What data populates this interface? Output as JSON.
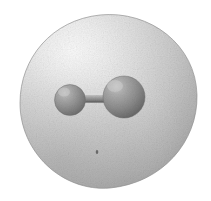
{
  "figure": {
    "kind": "molecular-orbital-isosurface-render",
    "title": "Diatomic molecule enclosed in electron density isosurface",
    "background_color": "#ffffff",
    "canvas": {
      "width": 211,
      "height": 201
    },
    "render_style": "grayscale dithered halftone shaded 3D render",
    "isosurface": {
      "name": "electron density isosurface",
      "shape": "egg-shaped ovoid, wider and rounder on the right, tapering to the left",
      "center_x": 108,
      "center_y": 101,
      "radius_x": 89,
      "radius_y": 87,
      "bounds": {
        "left": 20,
        "top": 14,
        "right": 197,
        "bottom": 188
      },
      "fill_light": "#f2f2f2",
      "fill_mid": "#c9c9c9",
      "fill_dark": "#9a9a9a",
      "rim_color": "#8e8e8e",
      "highlight_x": 72,
      "highlight_y": 52,
      "opacity": 0.92
    },
    "atoms": [
      {
        "label": "left atom",
        "cx": 70,
        "cy": 100,
        "r": 15.5,
        "fill_light": "#b4b4b4",
        "fill_mid": "#8d8d8d",
        "fill_dark": "#6a6a6a",
        "highlight_x": 64,
        "highlight_y": 92
      },
      {
        "label": "right atom",
        "cx": 124,
        "cy": 97,
        "r": 21,
        "fill_light": "#b8b8b8",
        "fill_mid": "#8a8a8a",
        "fill_dark": "#646464",
        "highlight_x": 115,
        "highlight_y": 86
      }
    ],
    "bond": {
      "label": "covalent bond cylinder",
      "x1": 70,
      "y1": 99,
      "x2": 124,
      "y2": 97,
      "thickness": 9,
      "fill_top": "#cfcfcf",
      "fill_mid": "#9d9d9d",
      "fill_bottom": "#6f6f6f"
    },
    "speck": {
      "label": "render artifact speck",
      "cx": 97,
      "cy": 152,
      "r": 1.6,
      "color": "#5a5a5a"
    }
  }
}
